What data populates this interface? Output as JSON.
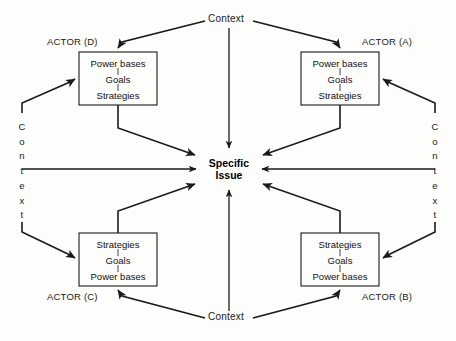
{
  "diagram": {
    "center": {
      "line1": "Specific",
      "line2": "Issue"
    },
    "actors": [
      {
        "id": "A",
        "label": "ACTOR (A)",
        "position": "top-right",
        "items": [
          "Power bases",
          "Goals",
          "Strategies"
        ]
      },
      {
        "id": "B",
        "label": "ACTOR (B)",
        "position": "bottom-right",
        "items": [
          "Strategies",
          "Goals",
          "Power bases"
        ]
      },
      {
        "id": "C",
        "label": "ACTOR (C)",
        "position": "bottom-left",
        "items": [
          "Strategies",
          "Goals",
          "Power bases"
        ]
      },
      {
        "id": "D",
        "label": "ACTOR (D)",
        "position": "top-left",
        "items": [
          "Power bases",
          "Goals",
          "Strategies"
        ]
      }
    ],
    "contexts": [
      {
        "id": "top",
        "label": "Context",
        "orientation": "horizontal"
      },
      {
        "id": "bottom",
        "label": "Context",
        "orientation": "horizontal"
      },
      {
        "id": "left",
        "label": "Context",
        "orientation": "vertical"
      },
      {
        "id": "right",
        "label": "Context",
        "orientation": "vertical"
      }
    ],
    "colors": {
      "stroke": "#1a1a1a",
      "background": "#fdfdfc",
      "text": "#111111",
      "dashed_connector": "#555555"
    }
  }
}
